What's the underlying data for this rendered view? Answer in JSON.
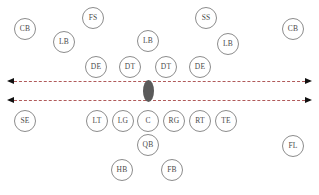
{
  "diagram": {
    "width": 319,
    "height": 195,
    "background_color": "#ffffff"
  },
  "ball": {
    "label": "football",
    "color": "#5a5a5a",
    "x": 148,
    "y": 90.5
  },
  "scrimmage_lines": [
    {
      "name": "defensive-line-of-scrimmage",
      "y": 81,
      "x_start": 14,
      "x_end": 305,
      "color": "#b05a5a",
      "style": "dashed",
      "arrows": "both"
    },
    {
      "name": "offensive-line-of-scrimmage",
      "y": 100,
      "x_start": 14,
      "x_end": 305,
      "color": "#b05a5a",
      "style": "dashed",
      "arrows": "both"
    }
  ],
  "arrow_color": "#111111",
  "players": [
    {
      "label": "CB",
      "name": "player-cb-left",
      "x": 25,
      "y": 29,
      "side": "defense"
    },
    {
      "label": "FS",
      "name": "player-fs",
      "x": 93,
      "y": 18,
      "side": "defense"
    },
    {
      "label": "SS",
      "name": "player-ss",
      "x": 206,
      "y": 18,
      "side": "defense"
    },
    {
      "label": "CB",
      "name": "player-cb-right",
      "x": 293,
      "y": 29,
      "side": "defense"
    },
    {
      "label": "LB",
      "name": "player-lb-left",
      "x": 64,
      "y": 42,
      "side": "defense"
    },
    {
      "label": "LB",
      "name": "player-lb-middle",
      "x": 148,
      "y": 41,
      "side": "defense"
    },
    {
      "label": "LB",
      "name": "player-lb-right",
      "x": 228,
      "y": 44,
      "side": "defense"
    },
    {
      "label": "DE",
      "name": "player-de-left",
      "x": 96,
      "y": 67,
      "side": "defense"
    },
    {
      "label": "DT",
      "name": "player-dt-left",
      "x": 130,
      "y": 67,
      "side": "defense"
    },
    {
      "label": "DT",
      "name": "player-dt-right",
      "x": 166,
      "y": 67,
      "side": "defense"
    },
    {
      "label": "DE",
      "name": "player-de-right",
      "x": 200,
      "y": 67,
      "side": "defense"
    },
    {
      "label": "SE",
      "name": "player-se",
      "x": 25,
      "y": 121,
      "side": "offense"
    },
    {
      "label": "LT",
      "name": "player-lt",
      "x": 97,
      "y": 121,
      "side": "offense"
    },
    {
      "label": "LG",
      "name": "player-lg",
      "x": 123,
      "y": 121,
      "side": "offense"
    },
    {
      "label": "C",
      "name": "player-c",
      "x": 148,
      "y": 121,
      "side": "offense"
    },
    {
      "label": "RG",
      "name": "player-rg",
      "x": 174,
      "y": 121,
      "side": "offense"
    },
    {
      "label": "RT",
      "name": "player-rt",
      "x": 200,
      "y": 121,
      "side": "offense"
    },
    {
      "label": "TE",
      "name": "player-te",
      "x": 226,
      "y": 121,
      "side": "offense"
    },
    {
      "label": "FL",
      "name": "player-fl",
      "x": 293,
      "y": 146,
      "side": "offense"
    },
    {
      "label": "QB",
      "name": "player-qb",
      "x": 148,
      "y": 145,
      "side": "offense"
    },
    {
      "label": "HB",
      "name": "player-hb",
      "x": 122,
      "y": 170,
      "side": "offense"
    },
    {
      "label": "FB",
      "name": "player-fb",
      "x": 172,
      "y": 170,
      "side": "offense"
    }
  ]
}
